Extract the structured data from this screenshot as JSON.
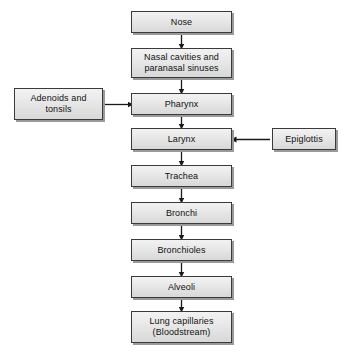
{
  "diagram": {
    "background_color": "#ffffff",
    "node_fill_top": "#f2f2f2",
    "node_fill_bottom": "#d8d8d8",
    "node_border_color": "#3a3a3a",
    "node_shadow_color": "#9a9a9a",
    "arrow_color": "#1a1a1a",
    "nodes": [
      {
        "id": "nose",
        "label": "Nose",
        "x": 131,
        "y": 11,
        "w": 101,
        "h": 22,
        "column": "main"
      },
      {
        "id": "nasal-cavities",
        "label": "Nasal cavities and\nparanasal sinuses",
        "x": 131,
        "y": 48,
        "w": 101,
        "h": 30,
        "column": "main"
      },
      {
        "id": "pharynx",
        "label": "Pharynx",
        "x": 131,
        "y": 93,
        "w": 101,
        "h": 22,
        "column": "main"
      },
      {
        "id": "larynx",
        "label": "Larynx",
        "x": 131,
        "y": 128,
        "w": 101,
        "h": 22,
        "column": "main"
      },
      {
        "id": "trachea",
        "label": "Trachea",
        "x": 131,
        "y": 165,
        "w": 101,
        "h": 22,
        "column": "main"
      },
      {
        "id": "bronchi",
        "label": "Bronchi",
        "x": 131,
        "y": 202,
        "w": 101,
        "h": 22,
        "column": "main"
      },
      {
        "id": "bronchioles",
        "label": "Bronchioles",
        "x": 131,
        "y": 239,
        "w": 101,
        "h": 22,
        "column": "main"
      },
      {
        "id": "alveoli",
        "label": "Alveoli",
        "x": 131,
        "y": 276,
        "w": 101,
        "h": 22,
        "column": "main"
      },
      {
        "id": "lung-capillaries",
        "label": "Lung capillaries\n(Bloodstream)",
        "x": 131,
        "y": 311,
        "w": 101,
        "h": 32,
        "column": "main"
      },
      {
        "id": "adenoids-tonsils",
        "label": "Adenoids and\ntonsils",
        "x": 14,
        "y": 88,
        "w": 89,
        "h": 32,
        "column": "left"
      },
      {
        "id": "epiglottis",
        "label": "Epiglottis",
        "x": 272,
        "y": 128,
        "w": 64,
        "h": 22,
        "column": "right"
      }
    ],
    "connections": [
      {
        "id": "nose-to-nasal-cavities",
        "from": "nose",
        "to": "nasal-cavities",
        "direction": "down"
      },
      {
        "id": "nasal-cavities-to-pharynx",
        "from": "nasal-cavities",
        "to": "pharynx",
        "direction": "down"
      },
      {
        "id": "pharynx-to-larynx",
        "from": "pharynx",
        "to": "larynx",
        "direction": "down"
      },
      {
        "id": "larynx-to-trachea",
        "from": "larynx",
        "to": "trachea",
        "direction": "down"
      },
      {
        "id": "trachea-to-bronchi",
        "from": "trachea",
        "to": "bronchi",
        "direction": "down"
      },
      {
        "id": "bronchi-to-bronchioles",
        "from": "bronchi",
        "to": "bronchioles",
        "direction": "down"
      },
      {
        "id": "bronchioles-to-alveoli",
        "from": "bronchioles",
        "to": "alveoli",
        "direction": "down"
      },
      {
        "id": "alveoli-to-lung-capillaries",
        "from": "alveoli",
        "to": "lung-capillaries",
        "direction": "down"
      },
      {
        "id": "adenoids-to-pharynx",
        "from": "adenoids-tonsils",
        "to": "pharynx",
        "direction": "right"
      },
      {
        "id": "epiglottis-to-larynx",
        "from": "epiglottis",
        "to": "larynx",
        "direction": "left"
      }
    ]
  }
}
